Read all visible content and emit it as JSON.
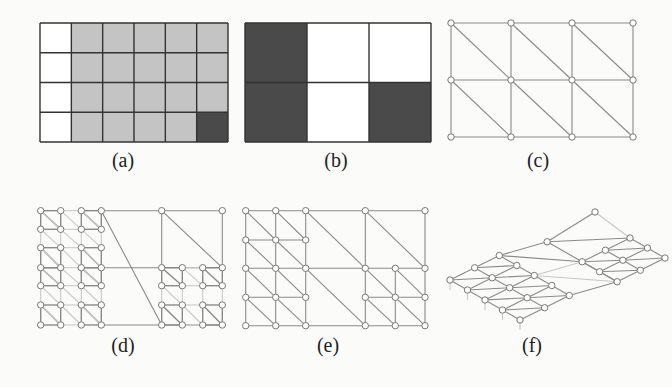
{
  "figure": {
    "colors": {
      "background": "#fbfbfa",
      "line": "#555555",
      "mesh_line": "#8a8a8a",
      "mesh_faint": "#c8c8c8",
      "cell_white": "#ffffff",
      "cell_gray": "#c4c4c4",
      "cell_dark": "#4a4a4a",
      "node_fill": "#ffffff",
      "node_stroke": "#777777"
    },
    "panels": [
      {
        "id": "a",
        "label": "(a)",
        "label_x": 123,
        "label_y": 149,
        "type": "cell-grid",
        "description": "6x4 grid of cells: first column white, others gray, bottom-right cell dark",
        "x0": 40,
        "y0": 23,
        "x1": 228,
        "y1": 142,
        "cols": 6,
        "rows": 4,
        "cells": [
          [
            "white",
            "gray",
            "gray",
            "gray",
            "gray",
            "gray"
          ],
          [
            "white",
            "gray",
            "gray",
            "gray",
            "gray",
            "gray"
          ],
          [
            "white",
            "gray",
            "gray",
            "gray",
            "gray",
            "gray"
          ],
          [
            "white",
            "gray",
            "gray",
            "gray",
            "gray",
            "dark"
          ]
        ]
      },
      {
        "id": "b",
        "label": "(b)",
        "label_x": 336,
        "label_y": 149,
        "type": "cell-grid",
        "description": "3x2 coarse grid with dark and white cells",
        "x0": 245,
        "y0": 23,
        "x1": 431,
        "y1": 142,
        "cols": 3,
        "rows": 2,
        "cells": [
          [
            "dark",
            "white",
            "white"
          ],
          [
            "dark",
            "white",
            "dark"
          ]
        ]
      },
      {
        "id": "c",
        "label": "(c)",
        "label_x": 538,
        "label_y": 149,
        "type": "triangle-mesh",
        "description": "4x3 node triangulated mesh, diagonals top-left to bottom-right",
        "xs": [
          451,
          511,
          572,
          633
        ],
        "ys": [
          23,
          80,
          137
        ]
      },
      {
        "id": "d",
        "label": "(d)",
        "label_x": 123,
        "label_y": 334,
        "type": "refined-mesh",
        "description": "Locally refined triangulated mesh with fine sub-blocks on left and bottom-right",
        "xs": [
          40.7,
          60.7,
          81.3,
          101.3,
          161.7,
          182.3,
          202.7,
          222.3
        ],
        "ys": [
          210.7,
          229.3,
          247.7,
          267.7,
          285.7,
          305,
          325
        ]
      },
      {
        "id": "e",
        "label": "(e)",
        "label_x": 328,
        "label_y": 334,
        "type": "refined-mesh",
        "description": "Graded triangulated mesh",
        "xs": [
          245.7,
          275.7,
          305.7,
          365.3,
          395.3,
          425
        ],
        "ys": [
          210.7,
          240,
          268.3,
          297.3,
          325.7
        ]
      },
      {
        "id": "f",
        "label": "(f)",
        "label_x": 532,
        "label_y": 334,
        "type": "3d-mesh",
        "description": "Perspective 3D view of refined mesh surface"
      }
    ]
  }
}
